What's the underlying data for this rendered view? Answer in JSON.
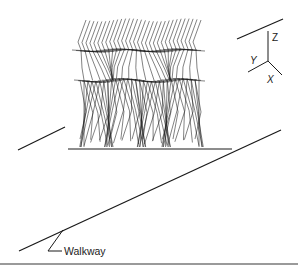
{
  "figure": {
    "type": "gait-stick-figure-sequence",
    "walkway_label": "Walkway",
    "axes": {
      "x_label": "X",
      "y_label": "Y",
      "z_label": "Z"
    },
    "line_color": "#1a1a1a",
    "frames": 30
  }
}
